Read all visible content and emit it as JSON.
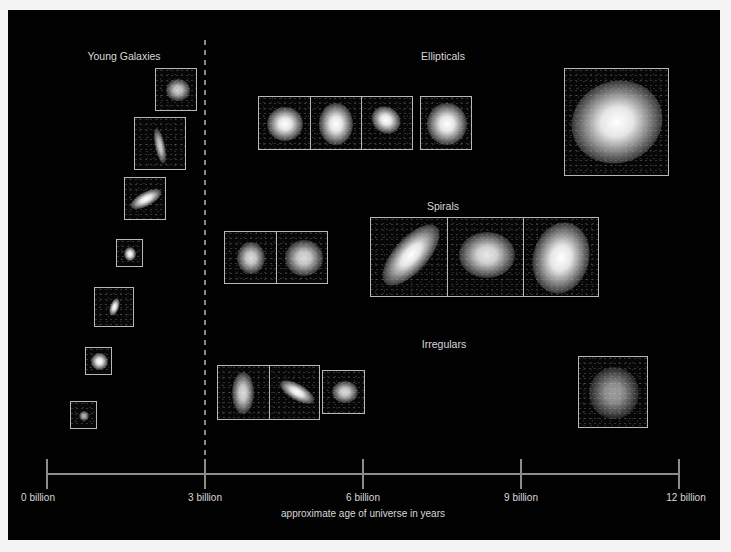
{
  "sections": {
    "young": {
      "label": "Young Galaxies"
    },
    "ellipticals": {
      "label": "Ellipticals"
    },
    "spirals": {
      "label": "Spirals"
    },
    "irregulars": {
      "label": "Irregulars"
    }
  },
  "axis": {
    "title": "approximate age of universe in years",
    "ticks": [
      "0 billion",
      "3 billion",
      "6 billion",
      "9 billion",
      "12 billion"
    ],
    "divider_at": "3 billion"
  },
  "colors": {
    "background": "#020202",
    "frame": "#b8b8b8",
    "axis": "#8c8c8c",
    "text": "#d8d8d8"
  }
}
